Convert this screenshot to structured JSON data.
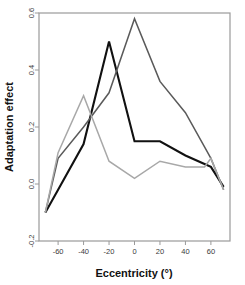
{
  "chart_data": {
    "type": "line",
    "title": "",
    "subtitle": "",
    "xlabel": "Eccentricity (°)",
    "ylabel": "Adaptation effect",
    "xlim": [
      -75,
      75
    ],
    "ylim": [
      -0.2,
      0.6
    ],
    "xticks": [
      -60,
      -40,
      -20,
      0,
      20,
      40,
      60
    ],
    "xtick_labels": [
      "-60",
      "-40",
      "-20",
      "0",
      "20",
      "40",
      "60"
    ],
    "yticks": [
      -0.2,
      0.0,
      0.2,
      0.4,
      0.6
    ],
    "ytick_labels": [
      "-0.2",
      "0.0",
      "0.2",
      "0.4",
      "0.6"
    ],
    "grid": false,
    "legend": "none",
    "x": [
      -70,
      -60,
      -40,
      -20,
      0,
      20,
      40,
      55,
      60,
      70
    ],
    "series": [
      {
        "name": "black",
        "color": "#111111",
        "width": 2.1,
        "values": [
          -0.1,
          -0.02,
          0.14,
          0.5,
          0.15,
          0.15,
          0.1,
          0.07,
          0.06,
          -0.01
        ]
      },
      {
        "name": "dark-gray",
        "color": "#5a5a5a",
        "width": 1.5,
        "values": [
          -0.1,
          0.09,
          0.2,
          0.32,
          0.58,
          0.36,
          0.25,
          0.13,
          0.09,
          -0.02
        ]
      },
      {
        "name": "light-gray",
        "color": "#a8a8a8",
        "width": 1.5,
        "values": [
          -0.1,
          0.11,
          0.31,
          0.08,
          0.02,
          0.08,
          0.06,
          0.06,
          0.09,
          -0.02
        ]
      }
    ]
  },
  "axes": {
    "x_title": "Eccentricity (°)",
    "y_title": "Adaptation effect"
  },
  "colors": {
    "series_black": "#111111",
    "series_dark_gray": "#5a5a5a",
    "series_light_gray": "#a8a8a8",
    "frame": "#9a9a9a",
    "background": "#ffffff"
  }
}
